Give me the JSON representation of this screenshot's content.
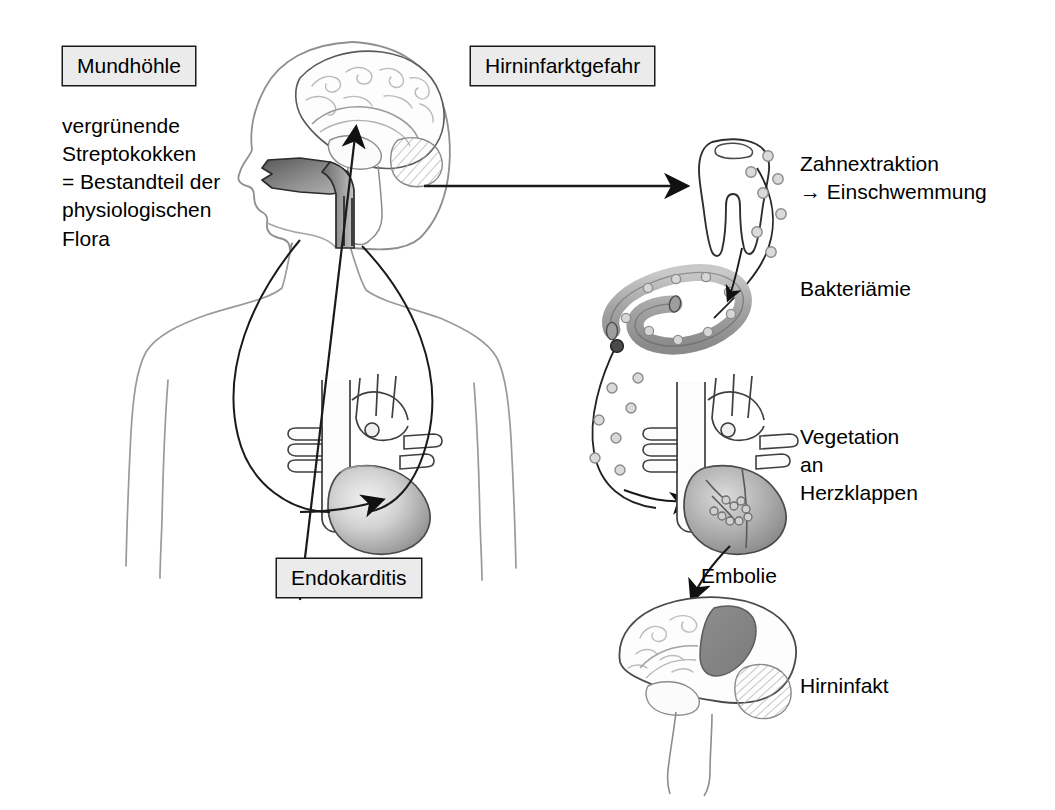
{
  "figure": {
    "language": "de",
    "background_color": "#ffffff",
    "ink_color": "#1a1a1a"
  },
  "labels": {
    "mundhoehle_box": "Mundhöhle",
    "hirninfarktgefahr_box": "Hirninfarktgefahr",
    "endokarditis_box": "Endokarditis",
    "flora_text": "vergrünende\nStreptokokken\n= Bestandteil der\nphysiologischen\nFlora",
    "zahnextraktion": "Zahnextraktion\n→ Einschwemmung",
    "bakteriaemie": "Bakteriämie",
    "vegetation": "Vegetation\nan\nHerzklappen",
    "embolie": "Embolie",
    "hirninfakt": "Hirninfakt"
  },
  "colors": {
    "box_fill": "#ebebeb",
    "box_border": "#1a1a1a",
    "outline": "#3a3a3a",
    "body_outline": "#8a8a8a",
    "mouth_shade_dark": "#6f6f6f",
    "mouth_shade_light": "#b9b9b9",
    "heart_shade_dark": "#9a9a9a",
    "heart_shade_light": "#e4e4e4",
    "vessel_fill": "#b0b0b0",
    "bacteria_fill": "#d9d9d9",
    "bacteria_stroke": "#8d8d8d",
    "infarct_fill": "#8a8a8a",
    "brain_line": "#b4b4b4",
    "cerebellum_hatch": "#b4b4b4"
  },
  "illustrations": [
    {
      "name": "head-with-brain",
      "description": "Lateral head profile with midsagittal brain, shaded oral cavity and pharynx"
    },
    {
      "name": "body-outline",
      "description": "Upper torso outline with shoulders and arms"
    },
    {
      "name": "heart-left",
      "description": "Heart with great vessels inside the thorax, shaded ventricle"
    },
    {
      "name": "tooth",
      "description": "Two-rooted molar tooth"
    },
    {
      "name": "blood-vessel-loop",
      "description": "Looped blood vessel segment carrying bacteria"
    },
    {
      "name": "heart-right",
      "description": "Heart with valve vegetations"
    },
    {
      "name": "brain-infarct",
      "description": "Midsagittal brain with dark grey infarct area and hatched cerebellum"
    }
  ],
  "arrows": [
    {
      "name": "mouth-to-tooth-arrow",
      "direction": "right"
    },
    {
      "name": "heart-to-brain-arrow",
      "direction": "up"
    },
    {
      "name": "circulation-to-heart-arrow",
      "direction": "into-heart"
    },
    {
      "name": "bacteria-to-heart-arrow",
      "direction": "into-heart"
    },
    {
      "name": "vessel-entry-arrow",
      "direction": "down-right"
    },
    {
      "name": "embolie-arrow",
      "direction": "down"
    }
  ],
  "bacteria_count": {
    "tooth_trail": 7,
    "vessel_lumen": 9,
    "heart_trail": 7,
    "valve_vegetation": 9
  }
}
